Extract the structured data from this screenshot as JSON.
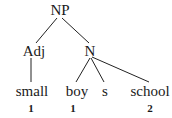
{
  "tree": {
    "root": "NP",
    "adj": "Adj",
    "n": "N",
    "leaves": [
      "small",
      "boy",
      "s",
      "school"
    ],
    "indices": [
      "1",
      "1",
      "2"
    ]
  }
}
